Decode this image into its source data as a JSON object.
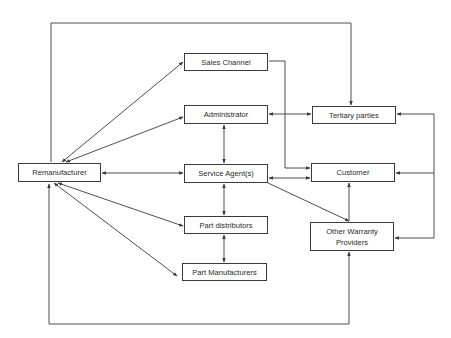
{
  "diagram": {
    "type": "flowchart",
    "nodes": {
      "remanufacturer": {
        "label": "Remanufacturer",
        "x": 18,
        "y": 163,
        "w": 83,
        "h": 19
      },
      "sales_channel": {
        "label": "Sales Channel",
        "x": 184,
        "y": 53,
        "w": 84,
        "h": 18
      },
      "administrator": {
        "label": "Administrator",
        "x": 184,
        "y": 105,
        "w": 84,
        "h": 19
      },
      "service_agents": {
        "label": "Service Agent(s)",
        "x": 184,
        "y": 164,
        "w": 84,
        "h": 19
      },
      "part_distributors": {
        "label": "Part distributors",
        "x": 184,
        "y": 216,
        "w": 84,
        "h": 18
      },
      "part_manufacturers": {
        "label": "Part Manufacturers",
        "x": 182,
        "y": 263,
        "w": 85,
        "h": 18
      },
      "tertiary_parties": {
        "label": "Tertiary parties",
        "x": 312,
        "y": 106,
        "w": 84,
        "h": 18
      },
      "customer": {
        "label": "Customer",
        "x": 311,
        "y": 163,
        "w": 84,
        "h": 19
      },
      "other_warranty_providers": {
        "label": "Other Warranty Providers",
        "x": 310,
        "y": 222,
        "w": 84,
        "h": 29
      }
    },
    "edges": [
      {
        "from": "remanufacturer",
        "to": "sales_channel",
        "direction": "both"
      },
      {
        "from": "remanufacturer",
        "to": "administrator",
        "direction": "both"
      },
      {
        "from": "remanufacturer",
        "to": "service_agents",
        "direction": "both"
      },
      {
        "from": "remanufacturer",
        "to": "part_distributors",
        "direction": "both"
      },
      {
        "from": "remanufacturer",
        "to": "part_manufacturers",
        "direction": "both"
      },
      {
        "from": "administrator",
        "to": "service_agents",
        "direction": "both"
      },
      {
        "from": "administrator",
        "to": "tertiary_parties",
        "direction": "both"
      },
      {
        "from": "service_agents",
        "to": "part_distributors",
        "direction": "both"
      },
      {
        "from": "part_distributors",
        "to": "part_manufacturers",
        "direction": "both"
      },
      {
        "from": "service_agents",
        "to": "customer",
        "direction": "both"
      },
      {
        "from": "service_agents",
        "to": "other_warranty_providers",
        "direction": "forward"
      },
      {
        "from": "sales_channel",
        "to": "customer",
        "direction": "forward"
      },
      {
        "from": "other_warranty_providers",
        "to": "customer",
        "direction": "forward"
      },
      {
        "from": "remanufacturer",
        "to": "tertiary_parties",
        "direction": "forward",
        "route": "top-loop"
      },
      {
        "from": "other_warranty_providers",
        "to": "remanufacturer",
        "direction": "both",
        "route": "bottom-loop"
      },
      {
        "from": "right-bracket",
        "to": "tertiary_parties",
        "direction": "forward"
      },
      {
        "from": "right-bracket",
        "to": "customer",
        "direction": "forward"
      },
      {
        "from": "right-bracket",
        "to": "other_warranty_providers",
        "direction": "forward"
      }
    ],
    "colors": {
      "line": "#3a3a3a",
      "text": "#2a2a2a",
      "background": "#ffffff"
    }
  }
}
